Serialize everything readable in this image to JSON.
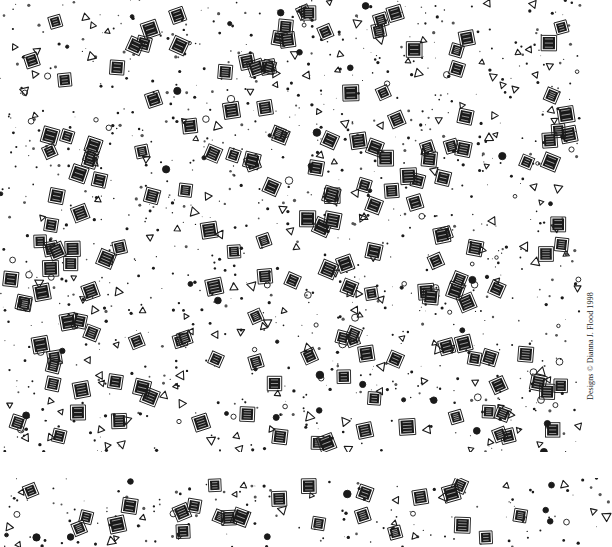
{
  "artwork": {
    "type": "decorative-pattern-sheet",
    "colors": {
      "background": "#ffffff",
      "ink": "#1a1a1a",
      "ink_light": "#555555"
    },
    "credit": "Designs © Dianna J. Flood 1998",
    "main_panel": {
      "top": 0,
      "height": 452,
      "seed": 7,
      "squares": 175,
      "triangles": 150,
      "circles": 90,
      "dots": 900
    },
    "strip_panel": {
      "top": 478,
      "height": 69,
      "seed": 7,
      "squares": 24,
      "triangles": 20,
      "circles": 14,
      "dots": 130
    },
    "motifs": [
      "square-in-square",
      "outline-triangle",
      "ring-circle",
      "ink-dot"
    ]
  }
}
